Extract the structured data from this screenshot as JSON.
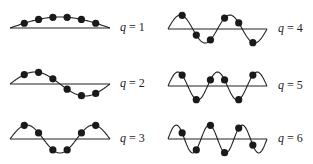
{
  "title": "",
  "bead_count": 6,
  "colors": {
    "ink": "#222222",
    "bead": "#1a1a1a",
    "background": "#ffffff"
  },
  "modes": [
    {
      "q": 1,
      "label_var": "q",
      "label_eq": " = ",
      "label_num": "1",
      "x0": 10,
      "x1": 110,
      "y": 28,
      "amp": 11,
      "label_x": 120,
      "label_y": 20
    },
    {
      "q": 2,
      "label_var": "q",
      "label_eq": " = ",
      "label_num": "2",
      "x0": 10,
      "x1": 110,
      "y": 84,
      "amp": 12,
      "label_x": 120,
      "label_y": 76
    },
    {
      "q": 3,
      "label_var": "q",
      "label_eq": " = ",
      "label_num": "3",
      "x0": 10,
      "x1": 110,
      "y": 139,
      "amp": 14,
      "label_x": 120,
      "label_y": 131
    },
    {
      "q": 4,
      "label_var": "q",
      "label_eq": " = ",
      "label_num": "4",
      "x0": 168,
      "x1": 267,
      "y": 29,
      "amp": 14,
      "label_x": 278,
      "label_y": 21
    },
    {
      "q": 5,
      "label_var": "q",
      "label_eq": " = ",
      "label_num": "5",
      "x0": 168,
      "x1": 267,
      "y": 86,
      "amp": 14,
      "label_x": 278,
      "label_y": 78
    },
    {
      "q": 6,
      "label_var": "q",
      "label_eq": " = ",
      "label_num": "6",
      "x0": 168,
      "x1": 267,
      "y": 139,
      "amp": 14,
      "label_x": 278,
      "label_y": 131
    }
  ]
}
